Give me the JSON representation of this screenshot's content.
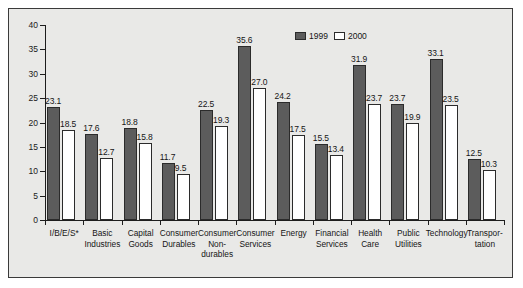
{
  "chart_data": {
    "type": "bar",
    "title": "",
    "xlabel": "",
    "ylabel": "",
    "ylim": [
      0,
      40
    ],
    "yticks": [
      0,
      5,
      10,
      15,
      20,
      25,
      30,
      35,
      40
    ],
    "grid": false,
    "legend_position": "top-right",
    "categories": [
      "I/B/E/S*",
      "Basic\nIndustries",
      "Capital\nGoods",
      "Consumer\nDurables",
      "Consumer\nNon-\ndurables",
      "Consumer\nServices",
      "Energy",
      "Financial\nServices",
      "Health\nCare",
      "Public\nUtilities",
      "Technology",
      "Transpor-\ntation"
    ],
    "series": [
      {
        "name": "1999",
        "color": "#5c5c5c",
        "values": [
          23.1,
          17.6,
          18.8,
          11.7,
          22.5,
          35.6,
          24.2,
          15.5,
          31.9,
          23.7,
          33.1,
          12.5
        ]
      },
      {
        "name": "2000",
        "color": "#ffffff",
        "values": [
          18.5,
          12.7,
          15.8,
          9.5,
          19.3,
          27.0,
          17.5,
          13.4,
          23.7,
          19.9,
          23.5,
          10.3
        ]
      }
    ]
  },
  "legend": {
    "entries": [
      {
        "label": "1999",
        "swatch": "dark"
      },
      {
        "label": "2000",
        "swatch": "light"
      }
    ]
  },
  "colors": {
    "background": "#e9e9e7",
    "frame_border": "#3a3a3a",
    "axis": "#1d1d1d",
    "bar_1999": "#5c5c5c",
    "bar_2000": "#ffffff",
    "bar_outline": "#2b2b2b",
    "text": "#151515"
  }
}
